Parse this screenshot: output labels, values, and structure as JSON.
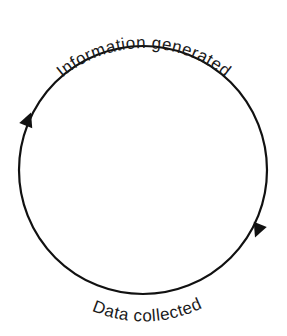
{
  "diagram": {
    "type": "cycle",
    "top_label": "Information generated",
    "bottom_label": "Data collected",
    "direction": "clockwise",
    "colors": {
      "stroke": "#111111",
      "text": "#1a1a1a",
      "background": "#ffffff"
    }
  }
}
